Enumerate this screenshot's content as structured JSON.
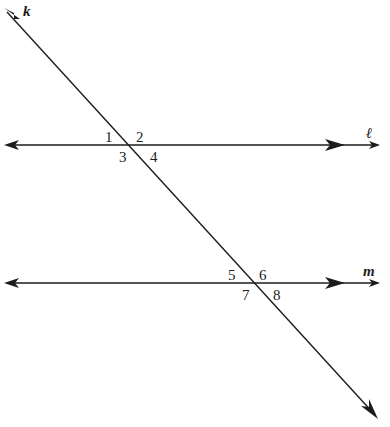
{
  "diagram": {
    "background_color": "#ffffff",
    "stroke_color": "#1c1c1c",
    "lines": [
      {
        "id": "transversal",
        "label": "k",
        "label_x": 23,
        "label_y": 4,
        "x1": 7,
        "y1": 12,
        "x2": 375,
        "y2": 415,
        "arrow_start": true,
        "arrow_end": true
      },
      {
        "id": "line-l",
        "label": "ℓ",
        "label_x": 366,
        "label_y": 126,
        "x1": 8,
        "y1": 145,
        "x2": 378,
        "y2": 145,
        "inner_arrow_x": 337,
        "arrow_start": true,
        "arrow_end": true
      },
      {
        "id": "line-m",
        "label": "m",
        "label_x": 363,
        "label_y": 264,
        "x1": 8,
        "y1": 283,
        "x2": 378,
        "y2": 283,
        "inner_arrow_x": 337,
        "arrow_start": true,
        "arrow_end": true
      }
    ],
    "intersections": [
      {
        "id": "upper-intersection",
        "line": "ℓ",
        "x": 132,
        "y": 145
      },
      {
        "id": "lower-intersection",
        "line": "m",
        "x": 249,
        "y": 283
      }
    ],
    "angle_labels": [
      {
        "id": "angle-1",
        "text": "1",
        "x": 105,
        "y": 130,
        "position": "upper-left",
        "intersection": "upper-intersection"
      },
      {
        "id": "angle-2",
        "text": "2",
        "x": 136,
        "y": 130,
        "position": "upper-right",
        "intersection": "upper-intersection"
      },
      {
        "id": "angle-3",
        "text": "3",
        "x": 119,
        "y": 150,
        "position": "lower-left",
        "intersection": "upper-intersection"
      },
      {
        "id": "angle-4",
        "text": "4",
        "x": 150,
        "y": 150,
        "position": "lower-right",
        "intersection": "upper-intersection"
      },
      {
        "id": "angle-5",
        "text": "5",
        "x": 228,
        "y": 268,
        "position": "upper-left",
        "intersection": "lower-intersection"
      },
      {
        "id": "angle-6",
        "text": "6",
        "x": 259,
        "y": 268,
        "position": "upper-right",
        "intersection": "lower-intersection"
      },
      {
        "id": "angle-7",
        "text": "7",
        "x": 242,
        "y": 288,
        "position": "lower-left",
        "intersection": "lower-intersection"
      },
      {
        "id": "angle-8",
        "text": "8",
        "x": 273,
        "y": 288,
        "position": "lower-right",
        "intersection": "lower-intersection"
      }
    ]
  }
}
